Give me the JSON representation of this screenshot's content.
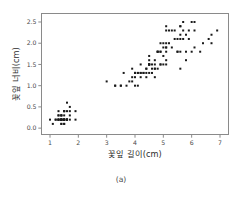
{
  "caption": "(a)",
  "colors": {
    "point": "#1a1a1a",
    "frame": "#8a8a8a",
    "tick_label": "#4a4a4a",
    "axis_label": "#2b2b2b",
    "background": "#ffffff"
  },
  "chart_data": {
    "type": "scatter",
    "title": "",
    "subtitle": "",
    "xlabel": "꽃잎 길이(cm)",
    "ylabel": "꽃잎 너비(cm)",
    "xlim": [
      0.7,
      7.3
    ],
    "ylim": [
      -0.15,
      2.7
    ],
    "xticks": [
      1,
      2,
      3,
      4,
      5,
      6,
      7
    ],
    "xtick_labels": [
      "1",
      "2",
      "3",
      "4",
      "5",
      "6",
      "7"
    ],
    "yticks": [
      0.0,
      0.5,
      1.0,
      1.5,
      2.0,
      2.5
    ],
    "ytick_labels": [
      "0.0",
      "0.5",
      "1.0",
      "1.5",
      "2.0",
      "2.5"
    ],
    "grid": false,
    "legend": false,
    "legend_position": "none",
    "marker": "square",
    "marker_size_px": 2,
    "n_points": 150,
    "x": [
      1.4,
      1.4,
      1.3,
      1.5,
      1.4,
      1.7,
      1.4,
      1.5,
      1.4,
      1.5,
      1.5,
      1.6,
      1.4,
      1.1,
      1.2,
      1.5,
      1.3,
      1.4,
      1.7,
      1.5,
      1.7,
      1.5,
      1.0,
      1.7,
      1.9,
      1.6,
      1.6,
      1.5,
      1.4,
      1.6,
      1.6,
      1.5,
      1.5,
      1.4,
      1.5,
      1.2,
      1.3,
      1.4,
      1.3,
      1.5,
      1.3,
      1.3,
      1.3,
      1.6,
      1.9,
      1.4,
      1.6,
      1.4,
      1.5,
      1.4,
      4.7,
      4.5,
      4.9,
      4.0,
      4.6,
      4.5,
      4.7,
      3.3,
      4.6,
      3.9,
      3.5,
      4.2,
      4.0,
      4.7,
      3.6,
      4.4,
      4.5,
      4.1,
      4.5,
      3.9,
      4.8,
      4.0,
      4.9,
      4.7,
      4.3,
      4.4,
      4.8,
      5.0,
      4.5,
      3.5,
      3.8,
      3.7,
      3.9,
      5.1,
      4.5,
      4.5,
      4.7,
      4.4,
      4.1,
      4.0,
      4.4,
      4.6,
      4.0,
      3.3,
      4.2,
      4.2,
      4.2,
      4.3,
      3.0,
      4.1,
      6.0,
      5.1,
      5.9,
      5.6,
      5.8,
      6.6,
      4.5,
      6.3,
      5.8,
      6.1,
      5.1,
      5.3,
      5.5,
      5.0,
      5.1,
      5.3,
      5.5,
      6.7,
      6.9,
      5.0,
      5.7,
      4.9,
      6.7,
      4.9,
      5.7,
      6.0,
      4.8,
      4.9,
      5.6,
      5.8,
      6.1,
      6.4,
      5.6,
      5.1,
      5.6,
      6.1,
      5.6,
      5.5,
      4.8,
      5.4,
      5.6,
      5.1,
      5.1,
      5.9,
      5.7,
      5.2,
      5.0,
      5.2,
      5.4,
      5.1
    ],
    "y": [
      0.2,
      0.2,
      0.2,
      0.2,
      0.2,
      0.4,
      0.3,
      0.2,
      0.2,
      0.1,
      0.2,
      0.2,
      0.1,
      0.1,
      0.2,
      0.4,
      0.4,
      0.3,
      0.3,
      0.3,
      0.2,
      0.4,
      0.2,
      0.5,
      0.2,
      0.2,
      0.4,
      0.2,
      0.2,
      0.2,
      0.2,
      0.4,
      0.1,
      0.2,
      0.2,
      0.2,
      0.2,
      0.1,
      0.2,
      0.2,
      0.3,
      0.3,
      0.2,
      0.6,
      0.4,
      0.3,
      0.2,
      0.2,
      0.2,
      0.2,
      1.4,
      1.5,
      1.5,
      1.3,
      1.5,
      1.3,
      1.6,
      1.0,
      1.3,
      1.4,
      1.0,
      1.5,
      1.0,
      1.4,
      1.3,
      1.4,
      1.5,
      1.0,
      1.5,
      1.1,
      1.8,
      1.3,
      1.5,
      1.2,
      1.3,
      1.4,
      1.4,
      1.7,
      1.5,
      1.0,
      1.1,
      1.0,
      1.2,
      1.6,
      1.5,
      1.6,
      1.5,
      1.3,
      1.3,
      1.3,
      1.2,
      1.4,
      1.2,
      1.0,
      1.3,
      1.2,
      1.3,
      1.3,
      1.1,
      1.3,
      2.5,
      1.9,
      2.1,
      1.8,
      2.2,
      2.1,
      1.7,
      1.8,
      1.8,
      2.5,
      2.0,
      1.9,
      2.1,
      2.0,
      2.4,
      2.3,
      1.8,
      2.2,
      2.3,
      1.5,
      2.3,
      2.0,
      2.0,
      1.8,
      2.1,
      1.8,
      1.8,
      1.8,
      2.1,
      1.6,
      1.9,
      2.0,
      2.2,
      1.5,
      1.4,
      2.3,
      2.4,
      1.8,
      1.8,
      2.1,
      2.4,
      2.3,
      1.9,
      2.3,
      2.5,
      2.3,
      1.9,
      2.0,
      2.3,
      1.8
    ]
  }
}
